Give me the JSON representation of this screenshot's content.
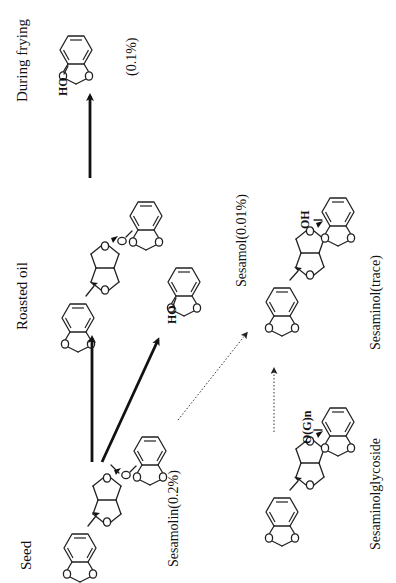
{
  "diagram": {
    "orientation": "rotated-90-ccw",
    "stages": {
      "seed": "Seed",
      "roasted_oil": "Roasted oil",
      "during_frying": "During frying"
    },
    "compounds": {
      "sesamolin": {
        "label": "Sesamolin(0.2%)"
      },
      "sesamol_frying": {
        "label": "(0.1%)",
        "substituent": "HO"
      },
      "sesamol_roasted": {
        "label": "Sesamol(0.01%)",
        "substituent": "HO"
      },
      "sesaminol": {
        "label": "Sesaminol(trace)",
        "substituent": "OH"
      },
      "sesaminol_glycoside": {
        "label": "Sesaminolglycoside",
        "substituent": "O(G)n"
      },
      "roasted_sesamolin": {
        "label": ""
      }
    },
    "arrows": [
      {
        "from": "sesamolin",
        "to": "roasted_sesamolin",
        "style": "solid-bold"
      },
      {
        "from": "sesamolin",
        "to": "sesamol_roasted",
        "style": "solid-bold"
      },
      {
        "from": "roasted_sesamolin",
        "to": "sesamol_frying",
        "style": "solid-bold"
      },
      {
        "from": "sesamolin",
        "to": "sesaminol",
        "style": "dotted"
      },
      {
        "from": "sesaminol_glycoside",
        "to": "sesaminol",
        "style": "dotted"
      }
    ],
    "colors": {
      "ink": "#111111",
      "background": "#ffffff"
    }
  }
}
